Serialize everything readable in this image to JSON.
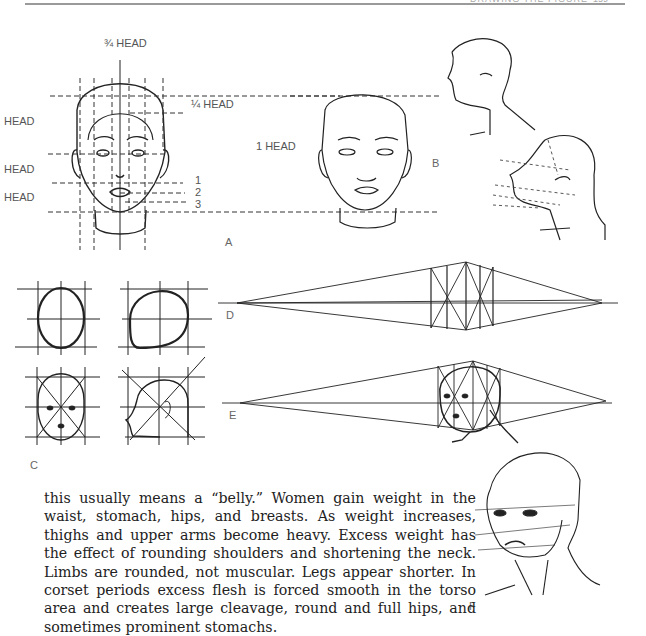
{
  "header": {
    "running_title": "DRAWING THE FIGURE",
    "page_number": "159"
  },
  "figure_a": {
    "label": "A",
    "top_label": "¾ HEAD",
    "quarter_label": "¼ HEAD",
    "left_labels": [
      "HEAD",
      "HEAD",
      "HEAD"
    ],
    "numbers": [
      "1",
      "2",
      "3"
    ]
  },
  "figure_b": {
    "label": "B",
    "one_head_label": "1 HEAD"
  },
  "figure_c": {
    "label": "C"
  },
  "figure_d": {
    "label": "D"
  },
  "figure_e": {
    "label": "E"
  },
  "figure_f": {
    "label": "F"
  },
  "body_text": "this usually means a “belly.” Women gain weight in the waist, stomach, hips, and breasts. As weight increases, thighs and upper arms become heavy. Excess weight has the effect of rounding shoulders and shortening the neck. Limbs are rounded, not muscular. Legs appear shorter. In corset periods excess flesh is forced smooth in the torso area and creates large cleavage, round and full hips, and sometimes prominent stomachs."
}
